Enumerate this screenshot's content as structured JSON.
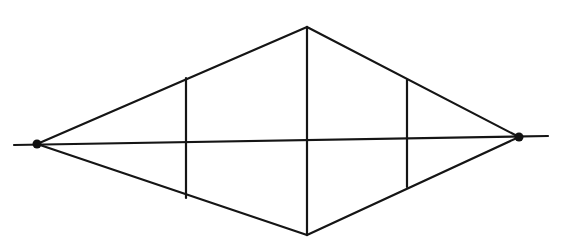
{
  "diagram": {
    "stroke_color": "#151515",
    "horizon_line": {
      "x1": 14,
      "y1": 145,
      "x2": 548,
      "y2": 136
    },
    "vanishing_points": [
      {
        "name": "left",
        "x": 37,
        "y": 144
      },
      {
        "name": "right",
        "x": 519,
        "y": 137
      }
    ],
    "top_vertex": {
      "x": 307,
      "y": 27
    },
    "bottom_vertex": {
      "x": 307,
      "y": 235
    },
    "vertical_lines": [
      {
        "name": "left",
        "x": 186,
        "y1": 78,
        "y2": 198
      },
      {
        "name": "center",
        "x": 307,
        "y1": 27,
        "y2": 235
      },
      {
        "name": "right",
        "x": 407,
        "y1": 80,
        "y2": 187
      }
    ]
  }
}
